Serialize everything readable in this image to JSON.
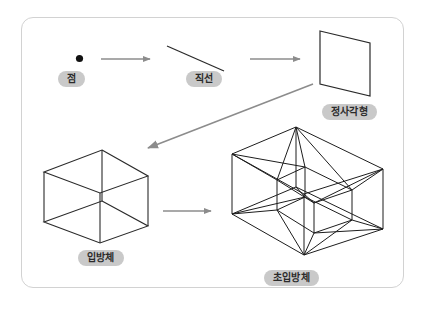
{
  "figure": {
    "card_border_color": "#d2d2d2",
    "background_color": "#ffffff",
    "stroke_color": "#1a1a1a",
    "arrow_color": "#8c8c8c",
    "pill_background_color": "#c9c9c9",
    "pill_text_color": "#2b2b2b"
  },
  "labels": {
    "point": "점",
    "line": "직선",
    "square": "정사각형",
    "cube": "입방체",
    "hypercube": "초입방체"
  },
  "shapes": {
    "point": {
      "name": "point-dot",
      "cx": 79.5,
      "cy": 58.5,
      "r": 3.5
    },
    "line": {
      "name": "line-segment",
      "x1": 167,
      "y1": 47,
      "x2": 223,
      "y2": 70
    },
    "square": {
      "name": "square-parallelogram",
      "points": "320,31 370,43 370,96 320,84"
    },
    "cube": {
      "name": "cube-wireframe",
      "top_back": "102,150",
      "left": "44,172",
      "right": "148,176",
      "front_mid": "100,193",
      "bottom_left": "44,222",
      "bottom_right": "148,226",
      "bottom_front": "100,243",
      "top_front": "100,193"
    },
    "hypercube": {
      "name": "hypercube-wireframe",
      "description": "tesseract projection: outer cell, inner cell, connecting edges"
    }
  },
  "arrows": [
    {
      "name": "arrow-point-to-line",
      "x1": 101,
      "y1": 59,
      "x2": 152,
      "y2": 59
    },
    {
      "name": "arrow-line-to-square",
      "x1": 249,
      "y1": 59,
      "x2": 302,
      "y2": 59
    },
    {
      "name": "arrow-square-to-cube",
      "x1": 312,
      "y1": 84,
      "x2": 146,
      "y2": 149
    },
    {
      "name": "arrow-cube-to-hyper",
      "x1": 163,
      "y1": 211,
      "x2": 213,
      "y2": 211
    }
  ]
}
